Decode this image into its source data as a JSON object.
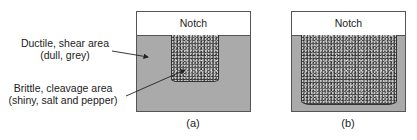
{
  "labels": {
    "ductile_line1": "Ductile, shear area",
    "ductile_line2": "(dull, grey)",
    "brittle_line1": "Brittle, cleavage area",
    "brittle_line2": "(shiny, salt and pepper)"
  },
  "panels": [
    {
      "notch_label": "Notch",
      "caption": "(a)"
    },
    {
      "notch_label": "Notch",
      "caption": "(b)"
    }
  ],
  "colors": {
    "ductile_region": "#aaaaaa",
    "brittle_region": "#5a5a5a",
    "notch": "#ffffff",
    "outline": "#555555"
  }
}
